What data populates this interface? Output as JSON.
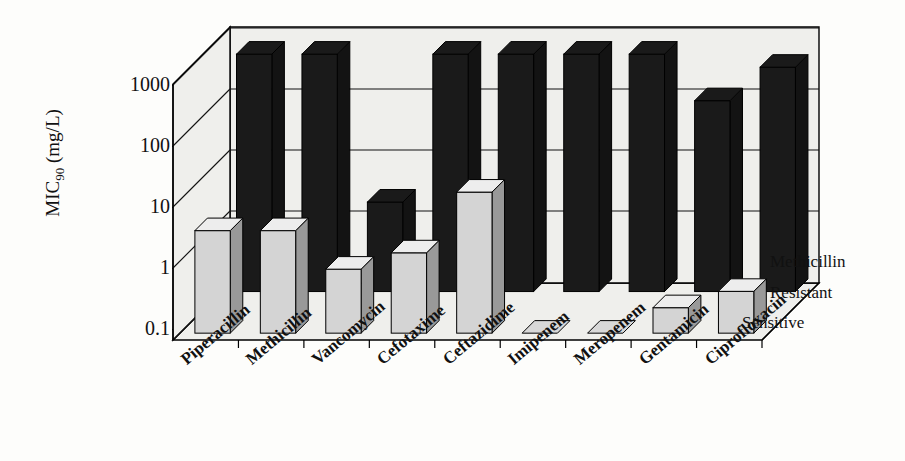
{
  "chart_data": {
    "type": "bar",
    "title": "",
    "subtitle": "",
    "xlabel": "",
    "ylabel": "MIC90 (mg/L)",
    "ylabel_main": "MIC",
    "ylabel_sub": "90",
    "ylabel_units": " (mg/L)",
    "yscale": "log",
    "ylim": [
      0.1,
      1000
    ],
    "yticks": [
      0.1,
      1,
      10,
      100,
      1000
    ],
    "ytick_labels": [
      "0.1",
      "1",
      "10",
      "100",
      "1000"
    ],
    "grid": true,
    "grid_axis": "y",
    "legend_position": "right-depth-axis",
    "three_d": true,
    "categories": [
      "Piperacillin",
      "Methicillin",
      "Vancomycin",
      "Cefotaxime",
      "Ceftazidime",
      "Imipenem",
      "Meropenem",
      "Gentamicin",
      "Ciprofloxacin"
    ],
    "series": [
      {
        "name": "Methicillin Resistant",
        "legend_lines": [
          "Methicillin",
          "Resistant"
        ],
        "color": "#1a1a1a",
        "row": "back",
        "values": [
          512,
          512,
          2.5,
          512,
          512,
          512,
          512,
          96,
          320
        ]
      },
      {
        "name": "Sensitive",
        "legend_lines": [
          "Sensitive"
        ],
        "color": "#d4d4d4",
        "row": "front",
        "values": [
          4,
          4,
          1,
          1.8,
          16,
          0.1,
          0.1,
          0.25,
          0.45
        ]
      }
    ],
    "depth_axis_labels": [
      "Methicillin",
      "Resistant",
      "Sensitive"
    ],
    "colors": {
      "resistant": "#1a1a1a",
      "sensitive": "#d4d4d4",
      "sensitive_side": "#9e9e9e",
      "resistant_side": "#2b2b2b",
      "plot_background": "#efefec",
      "axis": "#000000",
      "grid": "#222222",
      "page_background": "#fdfdfb"
    }
  }
}
